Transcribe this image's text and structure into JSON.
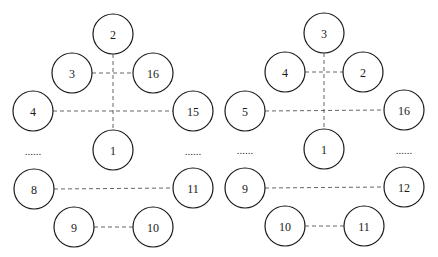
{
  "diagrams": [
    {
      "id": "left",
      "nodes": [
        {
          "label": "2",
          "x": 113,
          "y": 34
        },
        {
          "label": "3",
          "x": 72,
          "y": 73
        },
        {
          "label": "16",
          "x": 153,
          "y": 73
        },
        {
          "label": "4",
          "x": 33,
          "y": 111
        },
        {
          "label": "15",
          "x": 193,
          "y": 111
        },
        {
          "label": "1",
          "x": 113,
          "y": 150
        },
        {
          "label": "8",
          "x": 34,
          "y": 189
        },
        {
          "label": "11",
          "x": 193,
          "y": 188
        },
        {
          "label": "9",
          "x": 74,
          "y": 227
        },
        {
          "label": "10",
          "x": 153,
          "y": 227
        }
      ],
      "edges": [
        {
          "x1": 113,
          "y1": 54,
          "x2": 113,
          "y2": 130
        },
        {
          "x1": 92,
          "y1": 73,
          "x2": 133,
          "y2": 73
        },
        {
          "x1": 53,
          "y1": 111,
          "x2": 173,
          "y2": 111
        },
        {
          "x1": 54,
          "y1": 189,
          "x2": 173,
          "y2": 188
        },
        {
          "x1": 94,
          "y1": 227,
          "x2": 133,
          "y2": 227
        }
      ],
      "ellipses": [
        {
          "text": "......",
          "x": 33,
          "y": 155
        },
        {
          "text": "......",
          "x": 193,
          "y": 155
        }
      ]
    },
    {
      "id": "right",
      "nodes": [
        {
          "label": "3",
          "x": 324,
          "y": 33
        },
        {
          "label": "4",
          "x": 285,
          "y": 72
        },
        {
          "label": "2",
          "x": 363,
          "y": 72
        },
        {
          "label": "5",
          "x": 245,
          "y": 111
        },
        {
          "label": "16",
          "x": 404,
          "y": 110
        },
        {
          "label": "1",
          "x": 324,
          "y": 149
        },
        {
          "label": "9",
          "x": 245,
          "y": 188
        },
        {
          "label": "12",
          "x": 404,
          "y": 187
        },
        {
          "label": "10",
          "x": 285,
          "y": 226
        },
        {
          "label": "11",
          "x": 364,
          "y": 226
        }
      ],
      "edges": [
        {
          "x1": 324,
          "y1": 53,
          "x2": 324,
          "y2": 129
        },
        {
          "x1": 305,
          "y1": 72,
          "x2": 343,
          "y2": 72
        },
        {
          "x1": 265,
          "y1": 111,
          "x2": 384,
          "y2": 110
        },
        {
          "x1": 265,
          "y1": 188,
          "x2": 384,
          "y2": 187
        },
        {
          "x1": 305,
          "y1": 226,
          "x2": 344,
          "y2": 226
        }
      ],
      "ellipses": [
        {
          "text": "......",
          "x": 245,
          "y": 154
        },
        {
          "text": "......",
          "x": 404,
          "y": 154
        }
      ]
    }
  ],
  "style": {
    "node_radius": 20,
    "stroke": "#1a1a1a",
    "edge_color": "#555555"
  }
}
